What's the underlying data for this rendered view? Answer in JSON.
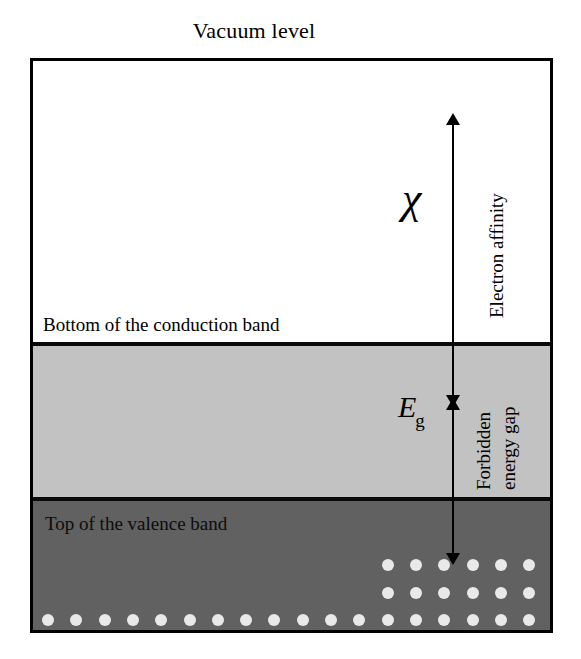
{
  "figure": {
    "title": "Vacuum level",
    "type": "semiconductor-energy-band-diagram"
  },
  "bands": {
    "conduction": {
      "label": "Bottom of the conduction band",
      "fill_color": "#ffffff"
    },
    "gap": {
      "fill_color": "#c2c2c2"
    },
    "valence": {
      "label": "Top of the valence band",
      "fill_color": "#616161"
    }
  },
  "measures": {
    "electron_affinity": {
      "symbol": "χ",
      "caption": "Electron affinity"
    },
    "energy_gap": {
      "symbol_base": "E",
      "symbol_sub": "g",
      "caption_line1": "Forbidden",
      "caption_line2": "energy gap"
    }
  },
  "electrons": {
    "dot_color": "#e9e9e9",
    "columns": 18,
    "rows": [
      {
        "name": "partial-row-1",
        "start_col": 13,
        "end_col": 18
      },
      {
        "name": "partial-row-2",
        "start_col": 13,
        "end_col": 18
      },
      {
        "name": "full-row-1",
        "start_col": 1,
        "end_col": 18
      },
      {
        "name": "full-row-2",
        "start_col": 1,
        "end_col": 18
      },
      {
        "name": "full-row-3",
        "start_col": 1,
        "end_col": 18
      }
    ]
  },
  "colors": {
    "outline": "#000000",
    "light_gray": "#c2c2c2",
    "dark_gray": "#616161",
    "electron": "#e9e9e9"
  }
}
